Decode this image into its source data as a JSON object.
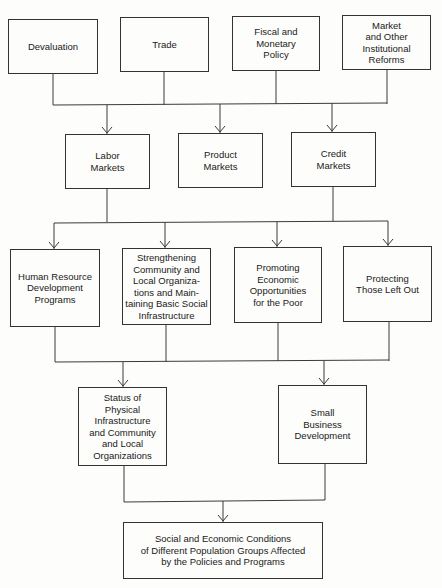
{
  "diagram": {
    "type": "flowchart",
    "direction": "top-to-bottom",
    "colors": {
      "line": "#3a3a3a",
      "box_border": "#333333",
      "background": "#fdfdfb",
      "text": "#1a1a1a"
    },
    "levels": [
      {
        "name": "policies",
        "nodes": [
          {
            "id": "devaluation",
            "label": "Devaluation"
          },
          {
            "id": "trade",
            "label": "Trade"
          },
          {
            "id": "fiscal",
            "label": "Fiscal and\nMonetary\nPolicy"
          },
          {
            "id": "reforms",
            "label": "Market\nand Other\nInstitutional\nReforms"
          }
        ]
      },
      {
        "name": "markets",
        "nodes": [
          {
            "id": "labor",
            "label": "Labor\nMarkets"
          },
          {
            "id": "product",
            "label": "Product\nMarkets"
          },
          {
            "id": "credit",
            "label": "Credit\nMarkets"
          }
        ]
      },
      {
        "name": "programs",
        "nodes": [
          {
            "id": "hrd",
            "label": "Human Resource\nDevelopment\nPrograms"
          },
          {
            "id": "strengthening",
            "label": "Strengthening\nCommunity and\nLocal Organiza-\ntions and Main-\ntaining Basic Social\nInfrastructure"
          },
          {
            "id": "promoting",
            "label": "Promoting\nEconomic\nOpportunities\nfor the Poor"
          },
          {
            "id": "protecting",
            "label": "Protecting\nThose Left Out"
          }
        ]
      },
      {
        "name": "intermediate-outcomes",
        "nodes": [
          {
            "id": "status",
            "label": "Status of\nPhysical\nInfrastructure\nand Community\nand Local\nOrganizations"
          },
          {
            "id": "smallbiz",
            "label": "Small\nBusiness\nDevelopment"
          }
        ]
      },
      {
        "name": "final-outcome",
        "nodes": [
          {
            "id": "conditions",
            "label": "Social and Economic Conditions\nof Different Population Groups Affected\nby the Policies and Programs"
          }
        ]
      }
    ],
    "edges": [
      {
        "from": [
          "devaluation",
          "trade",
          "fiscal",
          "reforms"
        ],
        "to": [
          "labor",
          "product",
          "credit"
        ]
      },
      {
        "from": [
          "labor",
          "credit"
        ],
        "to": [
          "hrd",
          "strengthening",
          "promoting",
          "protecting"
        ]
      },
      {
        "from": [
          "hrd",
          "strengthening",
          "promoting",
          "protecting"
        ],
        "to": [
          "status",
          "smallbiz"
        ]
      },
      {
        "from": [
          "status",
          "smallbiz"
        ],
        "to": [
          "conditions"
        ]
      }
    ]
  }
}
